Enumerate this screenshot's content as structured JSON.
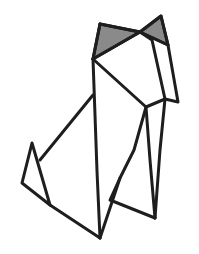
{
  "image": {
    "subject": "origami cat line drawing",
    "background": "#ffffff",
    "stroke_color": "#1e1e1e",
    "ear_fill": "#8a8a8a"
  },
  "shapes": {
    "left_ear": "100,24 140,32 93,59",
    "right_ear": "140,32 161,16 168,45",
    "outline_segments": [
      "100,24 140,32",
      "100,24 93,59",
      "93,59 140,32",
      "140,32 161,16 168,45 140,32",
      "93,59 146,107 165,99",
      "140,32 152,40 165,99",
      "168,45 178,102 165,99",
      "93,59 97,171 100,238",
      "146,107 134,150 120,178 100,238",
      "146,107 150,160 155,218",
      "165,99 160,150 155,218",
      "155,218 110,200 120,178",
      "93,95 40,160",
      "32,143 22,183 50,205 32,143",
      "50,205 100,238"
    ]
  }
}
